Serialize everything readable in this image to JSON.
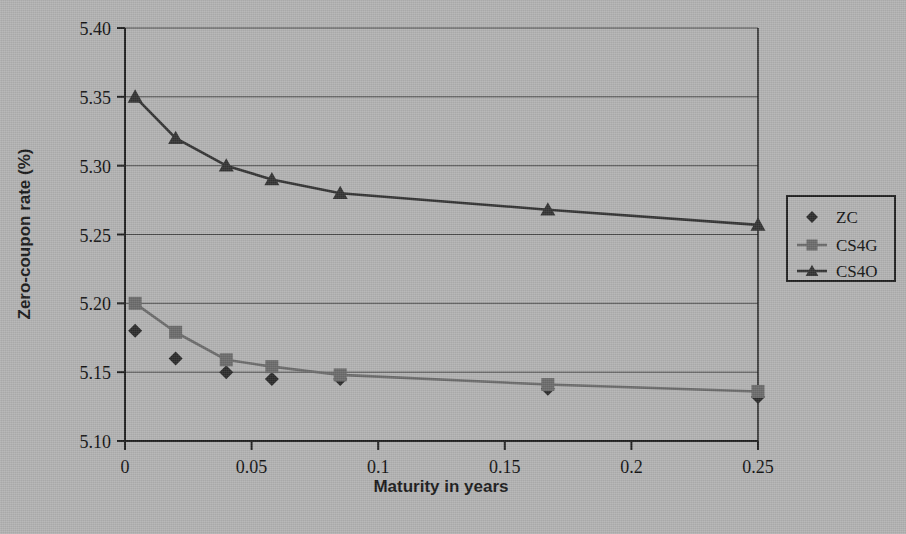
{
  "chart_data": {
    "type": "line",
    "title": "",
    "xlabel": "Maturity in years",
    "ylabel": "Zero-coupon rate (%)",
    "xlim": [
      0,
      0.25
    ],
    "ylim": [
      5.1,
      5.4
    ],
    "xticks": [
      0,
      0.05,
      0.1,
      0.15,
      0.2,
      0.25
    ],
    "xtick_labels": [
      "0",
      "0.05",
      "0.1",
      "0.15",
      "0.2",
      "0.25"
    ],
    "yticks": [
      5.1,
      5.15,
      5.2,
      5.25,
      5.3,
      5.35,
      5.4
    ],
    "ytick_labels": [
      "5.10",
      "5.15",
      "5.20",
      "5.25",
      "5.30",
      "5.35",
      "5.40"
    ],
    "grid": "horizontal",
    "legend_position": "right",
    "x": [
      0.004,
      0.02,
      0.04,
      0.058,
      0.085,
      0.167,
      0.25
    ],
    "series": [
      {
        "name": "ZC",
        "marker": "diamond",
        "line": "none",
        "color": "#2b2b2b",
        "values": [
          5.18,
          5.16,
          5.15,
          5.145,
          5.145,
          5.138,
          5.132
        ]
      },
      {
        "name": "CS4G",
        "marker": "square",
        "line": "solid",
        "color": "#6b6b6b",
        "values": [
          5.2,
          5.179,
          5.159,
          5.154,
          5.148,
          5.141,
          5.136
        ]
      },
      {
        "name": "CS4O",
        "marker": "triangle",
        "line": "solid",
        "color": "#333333",
        "values": [
          5.35,
          5.32,
          5.3,
          5.29,
          5.28,
          5.268,
          5.257
        ]
      }
    ]
  },
  "legend": {
    "entries": [
      {
        "label": "ZC"
      },
      {
        "label": "CS4G"
      },
      {
        "label": "CS4O"
      }
    ]
  },
  "colors": {
    "background": "#b2b2b2",
    "plot_background": "#b2b2b2",
    "axis": "#1f1f1f",
    "grid": "#4a4a4a",
    "zc": "#2b2b2b",
    "cs4g": "#6b6b6b",
    "cs4o": "#333333"
  }
}
